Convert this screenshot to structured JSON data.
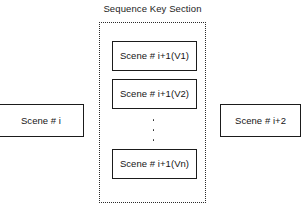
{
  "diagram": {
    "title": "Sequence Key Section",
    "background_color": "#ffffff",
    "line_color": "#1b1b1b",
    "text_color": "#151515",
    "dotted_border_color": "#2b2b2b",
    "canvas": {
      "width": 305,
      "height": 208
    }
  },
  "scenes": {
    "previous": {
      "label": "Scene # i"
    },
    "next": {
      "label": "Scene # i+2"
    }
  },
  "key_section": {
    "title": "Sequence Key Section",
    "variants": [
      {
        "label": "Scene # i+1(V1)"
      },
      {
        "label": "Scene # i+1(V2)"
      },
      {
        "label": "Scene # i+1(Vn)"
      }
    ],
    "ellipsis": {
      "orientation": "vertical",
      "dot_count": 3,
      "meaning": "additional variants omitted"
    }
  }
}
